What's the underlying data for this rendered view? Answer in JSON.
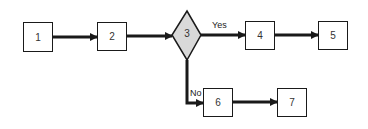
{
  "diagram": {
    "type": "flowchart",
    "colors": {
      "line": "#1a1a1a",
      "decision_fill": "#d9d9d9",
      "process_fill": "#ffffff"
    },
    "nodes": [
      {
        "id": "1",
        "label": "1",
        "shape": "box"
      },
      {
        "id": "2",
        "label": "2",
        "shape": "box"
      },
      {
        "id": "3",
        "label": "3",
        "shape": "diamond"
      },
      {
        "id": "4",
        "label": "4",
        "shape": "box"
      },
      {
        "id": "5",
        "label": "5",
        "shape": "box"
      },
      {
        "id": "6",
        "label": "6",
        "shape": "box"
      },
      {
        "id": "7",
        "label": "7",
        "shape": "box"
      }
    ],
    "edges": [
      {
        "from": "1",
        "to": "2",
        "label": ""
      },
      {
        "from": "2",
        "to": "3",
        "label": ""
      },
      {
        "from": "3",
        "to": "4",
        "label": "Yes"
      },
      {
        "from": "4",
        "to": "5",
        "label": ""
      },
      {
        "from": "3",
        "to": "6",
        "label": "No"
      },
      {
        "from": "6",
        "to": "7",
        "label": ""
      }
    ],
    "edge_labels": {
      "yes": "Yes",
      "no": "No"
    }
  }
}
